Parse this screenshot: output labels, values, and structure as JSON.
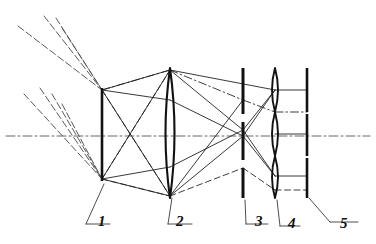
{
  "figure": {
    "type": "ray-diagram",
    "width": 376,
    "height": 244,
    "background": "#ffffff",
    "ink": "#111111",
    "ray_solid_color": "#222222",
    "ray_dashed_color": "#333333",
    "axis_color": "#555555"
  },
  "axis": {
    "name": "optical-axis",
    "y": 136,
    "x_start": 6,
    "x_end": 370,
    "style": "dash-dot"
  },
  "components": [
    {
      "id": 1,
      "label": "1",
      "name": "object-plane-bar",
      "kind": "aperture-bar",
      "x": 102,
      "y_top": 88,
      "y_bottom": 181,
      "thickness": 2.6,
      "label_pos": {
        "x": 98,
        "y": 214
      },
      "leader": [
        [
          104,
          184
        ],
        [
          86,
          224
        ],
        [
          110,
          224
        ]
      ]
    },
    {
      "id": 2,
      "label": "2",
      "name": "objective-lens",
      "kind": "biconvex-lens",
      "x": 170,
      "y_top": 68,
      "y_bottom": 198,
      "bulge": 9,
      "label_pos": {
        "x": 176,
        "y": 214
      },
      "leader": [
        [
          172,
          198
        ],
        [
          168,
          224
        ],
        [
          192,
          224
        ]
      ]
    },
    {
      "id": 3,
      "label": "3",
      "name": "segmented-field-stop",
      "kind": "segmented-bar",
      "x": 243,
      "y_top": 68,
      "y_bottom": 198,
      "thickness": 3.0,
      "segments": [
        [
          68,
          114
        ],
        [
          122,
          160
        ],
        [
          168,
          198
        ]
      ],
      "label_pos": {
        "x": 255,
        "y": 214
      },
      "leader": [
        [
          245,
          200
        ],
        [
          246,
          224
        ],
        [
          268,
          224
        ]
      ]
    },
    {
      "id": 4,
      "label": "4",
      "name": "lenslet-array",
      "kind": "lens-array",
      "x": 275,
      "y_top": 68,
      "y_bottom": 198,
      "bulge": 6,
      "lenslets": [
        [
          68,
          112
        ],
        [
          112,
          156
        ],
        [
          156,
          198
        ]
      ],
      "label_pos": {
        "x": 288,
        "y": 216
      },
      "leader": [
        [
          277,
          200
        ],
        [
          280,
          226
        ],
        [
          300,
          226
        ]
      ]
    },
    {
      "id": 5,
      "label": "5",
      "name": "segmented-detector",
      "kind": "segmented-bar",
      "x": 307,
      "y_top": 68,
      "y_bottom": 198,
      "thickness": 2.6,
      "segments": [
        [
          68,
          112
        ],
        [
          114,
          156
        ],
        [
          158,
          198
        ]
      ],
      "label_pos": {
        "x": 340,
        "y": 216
      },
      "leader": [
        [
          309,
          198
        ],
        [
          330,
          222
        ],
        [
          358,
          222
        ]
      ]
    }
  ],
  "incoming_rays": {
    "name": "incoming-ray-bundles",
    "style": "dashed",
    "upper_bundle_target": [
      102,
      90
    ],
    "lower_bundle_target": [
      102,
      179
    ],
    "upper": [
      [
        [
          18,
          26
        ],
        [
          102,
          90
        ]
      ],
      [
        [
          44,
          16
        ],
        [
          102,
          90
        ]
      ],
      [
        [
          56,
          18
        ],
        [
          102,
          90
        ]
      ],
      [
        [
          62,
          28
        ],
        [
          102,
          90
        ]
      ]
    ],
    "lower": [
      [
        [
          24,
          94
        ],
        [
          102,
          179
        ]
      ],
      [
        [
          40,
          88
        ],
        [
          102,
          179
        ]
      ],
      [
        [
          52,
          94
        ],
        [
          102,
          179
        ]
      ],
      [
        [
          62,
          104
        ],
        [
          102,
          179
        ]
      ]
    ]
  },
  "internal_rays": {
    "solid": [
      [
        [
          102,
          90
        ],
        [
          170,
          70
        ]
      ],
      [
        [
          102,
          90
        ],
        [
          170,
          100
        ]
      ],
      [
        [
          102,
          90
        ],
        [
          170,
          196
        ]
      ],
      [
        [
          102,
          179
        ],
        [
          170,
          196
        ]
      ],
      [
        [
          102,
          179
        ],
        [
          170,
          167
        ]
      ],
      [
        [
          102,
          179
        ],
        [
          170,
          70
        ]
      ],
      [
        [
          170,
          70
        ],
        [
          243,
          130
        ]
      ],
      [
        [
          170,
          100
        ],
        [
          243,
          136
        ]
      ],
      [
        [
          170,
          196
        ],
        [
          243,
          136
        ]
      ],
      [
        [
          170,
          167
        ],
        [
          243,
          130
        ]
      ],
      [
        [
          243,
          130
        ],
        [
          275,
          90
        ]
      ],
      [
        [
          243,
          136
        ],
        [
          275,
          90
        ]
      ],
      [
        [
          243,
          136
        ],
        [
          275,
          176
        ]
      ],
      [
        [
          243,
          130
        ],
        [
          275,
          176
        ]
      ],
      [
        [
          275,
          90
        ],
        [
          307,
          90
        ]
      ],
      [
        [
          275,
          134
        ],
        [
          307,
          134
        ]
      ],
      [
        [
          275,
          176
        ],
        [
          307,
          176
        ]
      ],
      [
        [
          170,
          70
        ],
        [
          275,
          90
        ]
      ],
      [
        [
          170,
          196
        ],
        [
          243,
          100
        ]
      ]
    ],
    "dashdot": [
      [
        [
          102,
          90
        ],
        [
          170,
          70
        ]
      ],
      [
        [
          170,
          70
        ],
        [
          243,
          100
        ]
      ],
      [
        [
          243,
          100
        ],
        [
          275,
          112
        ]
      ],
      [
        [
          275,
          112
        ],
        [
          307,
          112
        ]
      ]
    ],
    "dashed": [
      [
        [
          102,
          90
        ],
        [
          170,
          196
        ]
      ],
      [
        [
          102,
          179
        ],
        [
          170,
          196
        ]
      ],
      [
        [
          170,
          196
        ],
        [
          243,
          168
        ]
      ],
      [
        [
          243,
          168
        ],
        [
          275,
          190
        ]
      ],
      [
        [
          275,
          190
        ],
        [
          307,
          190
        ]
      ],
      [
        [
          102,
          179
        ],
        [
          170,
          70
        ]
      ]
    ]
  },
  "labels": [
    "1",
    "2",
    "3",
    "4",
    "5"
  ]
}
